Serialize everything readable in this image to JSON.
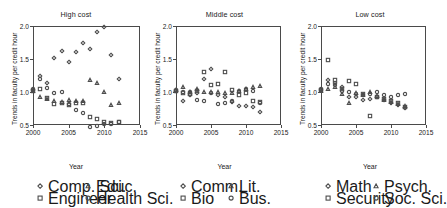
{
  "figure": {
    "xlabel": "Year",
    "ylabel": "Trends in faculty per credit hour",
    "xticks": [
      "2000",
      "2005",
      "2010",
      "2015"
    ],
    "yticks": [
      "0.5",
      "1.0",
      "1.5",
      "2.0"
    ]
  },
  "chart_data": {
    "type": "scatter",
    "title": "",
    "xlabel": "Year",
    "ylabel": "Trends in faculty per credit hour",
    "xlim": [
      2000,
      2015
    ],
    "ylim": [
      0.5,
      2.0
    ],
    "xticks": [
      2000,
      2005,
      2010,
      2015
    ],
    "yticks": [
      0.5,
      1.0,
      1.5,
      2.0
    ],
    "grid": false,
    "legend_position": "below-panel",
    "marker_style": "open",
    "panels": [
      {
        "title": "High cost",
        "series": [
          {
            "name": "Comp. Sci.",
            "marker": "diamond",
            "points": [
              [
                2000,
                1.03
              ],
              [
                2001,
                1.25
              ],
              [
                2002,
                1.14
              ],
              [
                2003,
                1.51
              ],
              [
                2004,
                1.62
              ],
              [
                2005,
                1.45
              ],
              [
                2006,
                1.6
              ],
              [
                2007,
                1.74
              ],
              [
                2008,
                1.65
              ],
              [
                2009,
                1.91
              ],
              [
                2010,
                1.98
              ],
              [
                2011,
                1.56
              ],
              [
                2012,
                1.19
              ]
            ]
          },
          {
            "name": "Educ.",
            "marker": "triangle",
            "points": [
              [
                2000,
                1.02
              ],
              [
                2001,
                0.93
              ],
              [
                2002,
                0.9
              ],
              [
                2003,
                0.86
              ],
              [
                2004,
                0.85
              ],
              [
                2005,
                0.88
              ],
              [
                2006,
                0.87
              ],
              [
                2007,
                0.86
              ],
              [
                2008,
                1.18
              ],
              [
                2009,
                1.13
              ],
              [
                2010,
                1.0
              ],
              [
                2011,
                0.8
              ],
              [
                2012,
                0.84
              ]
            ]
          },
          {
            "name": "Engineer",
            "marker": "square",
            "points": [
              [
                2000,
                1.02
              ],
              [
                2001,
                1.04
              ],
              [
                2002,
                0.91
              ],
              [
                2003,
                0.82
              ],
              [
                2004,
                0.83
              ],
              [
                2005,
                0.8
              ],
              [
                2006,
                0.83
              ],
              [
                2007,
                0.84
              ],
              [
                2008,
                0.62
              ],
              [
                2009,
                0.59
              ],
              [
                2010,
                0.55
              ],
              [
                2011,
                0.53
              ],
              [
                2012,
                0.54
              ]
            ]
          },
          {
            "name": "Health Sci.",
            "marker": "circle",
            "points": [
              [
                2000,
                1.04
              ],
              [
                2001,
                1.2
              ],
              [
                2002,
                1.06
              ],
              [
                2003,
                0.99
              ],
              [
                2004,
                1.0
              ],
              [
                2005,
                0.82
              ],
              [
                2006,
                0.72
              ],
              [
                2007,
                0.68
              ],
              [
                2008,
                0.47
              ],
              [
                2009,
                0.48
              ],
              [
                2010,
                0.51
              ],
              [
                2011,
                0.52
              ],
              [
                2012,
                0.54
              ]
            ]
          }
        ]
      },
      {
        "title": "Middle cost",
        "series": [
          {
            "name": "Comm.",
            "marker": "diamond",
            "points": [
              [
                2000,
                1.02
              ],
              [
                2001,
                0.87
              ],
              [
                2002,
                0.96
              ],
              [
                2003,
                0.98
              ],
              [
                2004,
                1.2
              ],
              [
                2005,
                1.35
              ],
              [
                2006,
                0.95
              ],
              [
                2007,
                0.93
              ],
              [
                2008,
                0.85
              ],
              [
                2009,
                0.79
              ],
              [
                2010,
                0.79
              ],
              [
                2011,
                0.78
              ],
              [
                2012,
                0.7
              ]
            ]
          },
          {
            "name": "Lit.",
            "marker": "triangle",
            "points": [
              [
                2000,
                1.03
              ],
              [
                2001,
                1.08
              ],
              [
                2002,
                1.0
              ],
              [
                2003,
                1.04
              ],
              [
                2004,
                1.0
              ],
              [
                2005,
                1.0
              ],
              [
                2006,
                1.0
              ],
              [
                2007,
                0.98
              ],
              [
                2008,
                0.99
              ],
              [
                2009,
                1.02
              ],
              [
                2010,
                1.05
              ],
              [
                2011,
                1.07
              ],
              [
                2012,
                1.09
              ]
            ]
          },
          {
            "name": "Bio",
            "marker": "square",
            "points": [
              [
                2000,
                1.02
              ],
              [
                2001,
                0.99
              ],
              [
                2002,
                0.97
              ],
              [
                2003,
                1.02
              ],
              [
                2004,
                1.3
              ],
              [
                2005,
                1.1
              ],
              [
                2006,
                1.12
              ],
              [
                2007,
                1.31
              ],
              [
                2008,
                1.03
              ],
              [
                2009,
                0.95
              ],
              [
                2010,
                0.99
              ],
              [
                2011,
                0.86
              ],
              [
                2012,
                0.85
              ]
            ]
          },
          {
            "name": "Bus.",
            "marker": "circle",
            "points": [
              [
                2000,
                1.03
              ],
              [
                2001,
                1.0
              ],
              [
                2002,
                1.0
              ],
              [
                2003,
                0.88
              ],
              [
                2004,
                0.86
              ],
              [
                2005,
                0.98
              ],
              [
                2006,
                0.82
              ],
              [
                2007,
                0.83
              ],
              [
                2008,
                0.86
              ],
              [
                2009,
                1.02
              ],
              [
                2010,
                1.05
              ],
              [
                2011,
                1.02
              ],
              [
                2012,
                0.84
              ]
            ]
          }
        ]
      },
      {
        "title": "Low cost",
        "series": [
          {
            "name": "Math",
            "marker": "diamond",
            "points": [
              [
                2000,
                1.03
              ],
              [
                2001,
                1.18
              ],
              [
                2002,
                1.14
              ],
              [
                2003,
                1.07
              ],
              [
                2004,
                0.93
              ],
              [
                2005,
                0.92
              ],
              [
                2006,
                0.88
              ],
              [
                2007,
                0.9
              ],
              [
                2008,
                0.93
              ],
              [
                2009,
                0.88
              ],
              [
                2010,
                0.83
              ],
              [
                2011,
                0.8
              ],
              [
                2012,
                0.76
              ]
            ]
          },
          {
            "name": "Psych.",
            "marker": "triangle",
            "points": [
              [
                2000,
                1.02
              ],
              [
                2001,
                1.05
              ],
              [
                2002,
                1.08
              ],
              [
                2003,
                0.97
              ],
              [
                2004,
                0.83
              ],
              [
                2005,
                0.98
              ],
              [
                2006,
                0.95
              ],
              [
                2007,
                1.0
              ],
              [
                2008,
                0.94
              ],
              [
                2009,
                0.88
              ],
              [
                2010,
                0.85
              ],
              [
                2011,
                0.82
              ],
              [
                2012,
                0.79
              ]
            ]
          },
          {
            "name": "Security",
            "marker": "square",
            "points": [
              [
                2000,
                1.03
              ],
              [
                2001,
                1.49
              ],
              [
                2002,
                1.18
              ],
              [
                2003,
                1.04
              ],
              [
                2004,
                1.16
              ],
              [
                2005,
                1.12
              ],
              [
                2006,
                0.97
              ],
              [
                2007,
                0.64
              ],
              [
                2008,
                0.92
              ],
              [
                2009,
                0.9
              ],
              [
                2010,
                0.86
              ],
              [
                2011,
                0.84
              ],
              [
                2012,
                0.78
              ]
            ]
          },
          {
            "name": "Soc. Sci.",
            "marker": "circle",
            "points": [
              [
                2000,
                1.04
              ],
              [
                2001,
                1.12
              ],
              [
                2002,
                1.11
              ],
              [
                2003,
                1.02
              ],
              [
                2004,
                1.0
              ],
              [
                2005,
                0.97
              ],
              [
                2006,
                0.95
              ],
              [
                2007,
                0.97
              ],
              [
                2008,
                1.0
              ],
              [
                2009,
                0.95
              ],
              [
                2010,
                0.93
              ],
              [
                2011,
                0.96
              ],
              [
                2012,
                0.97
              ]
            ]
          }
        ]
      }
    ]
  }
}
